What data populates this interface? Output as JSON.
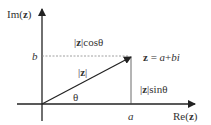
{
  "diagram": {
    "type": "complex-plane",
    "colors": {
      "axis": "#222222",
      "vector": "#222222",
      "dashed": "#888888",
      "text": "#333333"
    },
    "axes": {
      "y_label_prefix": "Im(",
      "y_label_var": "z",
      "y_label_suffix": ")",
      "x_label_prefix": "Re(",
      "x_label_var": "z",
      "x_label_suffix": ")"
    },
    "labels": {
      "b": "b",
      "a": "a",
      "theta": "θ",
      "modulus_left": "|",
      "modulus_var": "z",
      "modulus_right": "|",
      "cos_prefix": "|",
      "cos_var": "z",
      "cos_suffix": "|cosθ",
      "sin_prefix": "|",
      "sin_var": "z",
      "sin_suffix": "|sinθ",
      "point_var": "z",
      "point_eq": " = ",
      "point_a": "a",
      "point_plus": "+",
      "point_bi": "bi"
    }
  }
}
